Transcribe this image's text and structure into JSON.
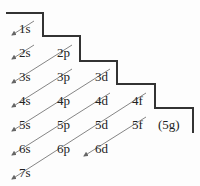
{
  "diagram": {
    "title": "",
    "type": "aufbau-orbital-filling-order",
    "colors": {
      "line": "#333333",
      "arrow": "#777777",
      "text": "#222222"
    },
    "orbitals": [
      {
        "label": "1s",
        "x": 19,
        "y": 22
      },
      {
        "label": "2s",
        "x": 19,
        "y": 46
      },
      {
        "label": "2p",
        "x": 57,
        "y": 46
      },
      {
        "label": "3s",
        "x": 19,
        "y": 70
      },
      {
        "label": "3p",
        "x": 57,
        "y": 70
      },
      {
        "label": "3d",
        "x": 95,
        "y": 70
      },
      {
        "label": "4s",
        "x": 19,
        "y": 94
      },
      {
        "label": "4p",
        "x": 57,
        "y": 94
      },
      {
        "label": "4d",
        "x": 95,
        "y": 94
      },
      {
        "label": "4f",
        "x": 132,
        "y": 94
      },
      {
        "label": "5s",
        "x": 19,
        "y": 118
      },
      {
        "label": "5p",
        "x": 57,
        "y": 118
      },
      {
        "label": "5d",
        "x": 95,
        "y": 118
      },
      {
        "label": "5f",
        "x": 132,
        "y": 118
      },
      {
        "label": "(5g)",
        "x": 158,
        "y": 118
      },
      {
        "label": "6s",
        "x": 19,
        "y": 142
      },
      {
        "label": "6p",
        "x": 57,
        "y": 142
      },
      {
        "label": "6d",
        "x": 95,
        "y": 142
      },
      {
        "label": "7s",
        "x": 19,
        "y": 166
      }
    ],
    "staircase_points": "6,13 43,13 43,36 80,36 80,61 117,61 117,84 155,84 155,108 193,108 193,133",
    "arrows": [
      {
        "from": "1s",
        "x1": 34,
        "y1": 21,
        "x2": 12,
        "y2": 35
      },
      {
        "from": "2s",
        "x1": 34,
        "y1": 45,
        "x2": 12,
        "y2": 59
      },
      {
        "from": "2p",
        "x1": 72,
        "y1": 45,
        "x2": 12,
        "y2": 83
      },
      {
        "from": "3p",
        "x1": 72,
        "y1": 69,
        "x2": 12,
        "y2": 107
      },
      {
        "from": "3d",
        "x1": 110,
        "y1": 69,
        "x2": 12,
        "y2": 131
      },
      {
        "from": "4d",
        "x1": 110,
        "y1": 93,
        "x2": 12,
        "y2": 155
      },
      {
        "from": "4f",
        "x1": 146,
        "y1": 93,
        "x2": 12,
        "y2": 179
      },
      {
        "from": "5f",
        "x1": 146,
        "y1": 117,
        "x2": 84,
        "y2": 156
      }
    ]
  }
}
